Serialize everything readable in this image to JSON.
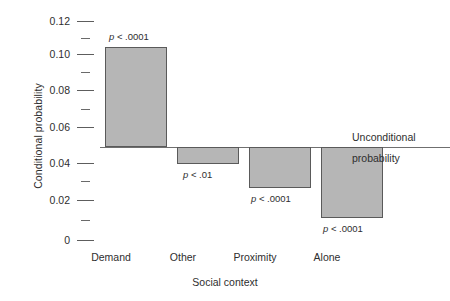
{
  "chart_data": {
    "type": "bar",
    "title": "",
    "subtitle": "",
    "xlabel": "Social context",
    "ylabel": "Conditional probability",
    "categories": [
      "Demand",
      "Other",
      "Proximity",
      "Alone"
    ],
    "values": [
      0.104,
      0.042,
      0.0285,
      0.012
    ],
    "baseline": 0.051,
    "baseline_label_line1": "Unconditional",
    "baseline_label_line2": "probability",
    "annotations": [
      "p < .0001",
      "p < .01",
      "p < .0001",
      "p < .0001"
    ],
    "annotation_positions": [
      "above",
      "below",
      "below",
      "below"
    ],
    "ylim": [
      0,
      0.12
    ],
    "yticks_major": [
      0,
      0.02,
      0.04,
      0.06,
      0.08,
      0.1,
      0.12
    ],
    "ytick_labels": [
      "0",
      "0.02",
      "0.04",
      "0.06",
      "0.08",
      "0.10",
      "0.12"
    ],
    "yticks_minor": [
      0.01,
      0.03,
      0.05,
      0.07,
      0.09,
      0.11
    ],
    "grid": false,
    "legend": "none",
    "bar_fill_color": "#b6b6b6",
    "bar_edge_color": "#5a5a5a",
    "axis_color": "#6f6f6f"
  },
  "axes": {
    "y_title": "Conditional probability",
    "x_title": "Social context",
    "y_labels": {
      "t0": "0",
      "t1": "0.02",
      "t2": "0.04",
      "t3": "0.06",
      "t4": "0.08",
      "t5": "0.10",
      "t6": "0.12"
    }
  },
  "bars": [
    {
      "category": "Demand",
      "value": 0.104,
      "annotation": "p < .0001"
    },
    {
      "category": "Other",
      "value": 0.042,
      "annotation": "p < .01"
    },
    {
      "category": "Proximity",
      "value": 0.0285,
      "annotation": "p < .0001"
    },
    {
      "category": "Alone",
      "value": 0.012,
      "annotation": "p < .0001"
    }
  ],
  "baseline_annotation": {
    "line1": "Unconditional",
    "line2": "probability"
  }
}
